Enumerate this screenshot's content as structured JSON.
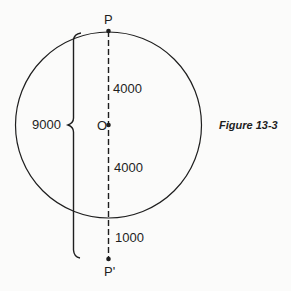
{
  "figure": {
    "caption": "Figure 13-3",
    "points": {
      "top": "P",
      "center": "O",
      "bottom": "P'"
    },
    "labels": {
      "upper_segment": "4000",
      "lower_segment": "4000",
      "outside_segment": "1000",
      "brace_total": "9000"
    },
    "colors": {
      "stroke": "#1e1e1e",
      "background": "#fbfbfa"
    }
  }
}
